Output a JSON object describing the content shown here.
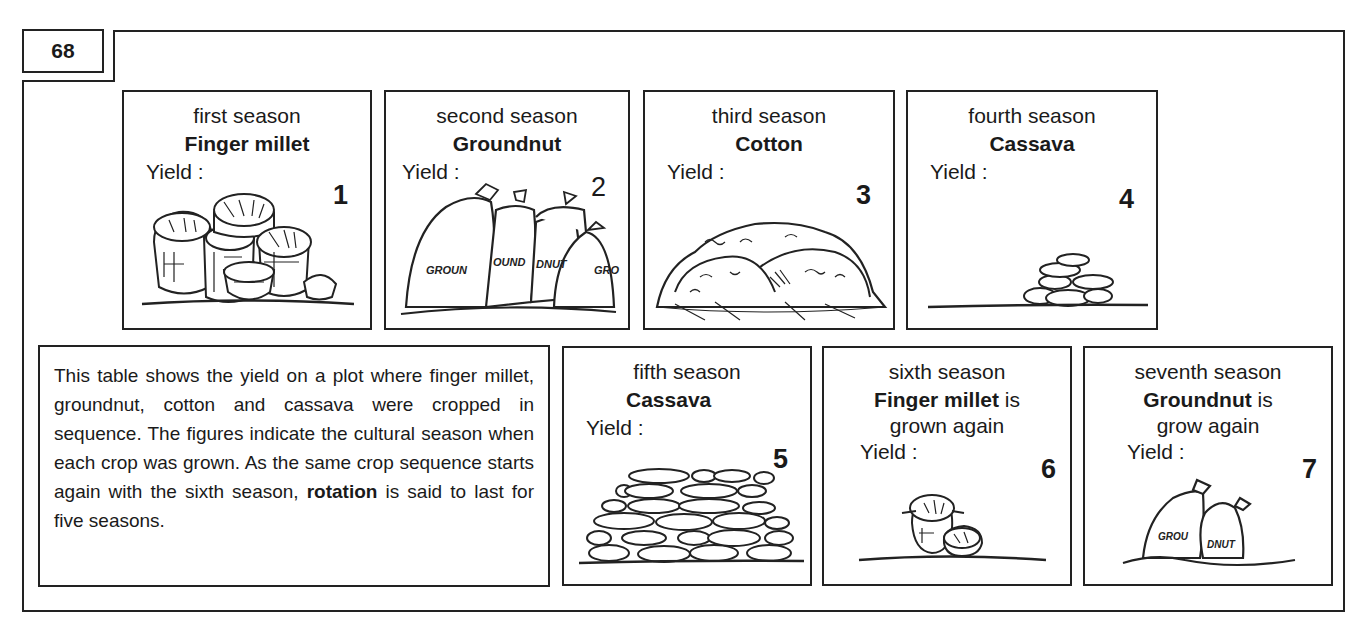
{
  "page": {
    "number": "68"
  },
  "description": {
    "before_bold": "This table shows the yield on a plot where finger millet, groundnut, cotton and cassava were cropped in sequence. The figures indicate the cultural season when each crop was grown. As the same crop sequence starts again with the sixth season, ",
    "bold": "rotation",
    "after_bold": " is said to last for five seasons."
  },
  "seasons": [
    {
      "season": "first season",
      "crop": "Finger millet",
      "suffix": "",
      "again": "",
      "yield_label": "Yield :",
      "number": "1",
      "illustration": "finger-millet-baskets-large"
    },
    {
      "season": "second season",
      "crop": "Groundnut",
      "suffix": "",
      "again": "",
      "yield_label": "Yield :",
      "number": "2",
      "illustration": "groundnut-sacks-large"
    },
    {
      "season": "third season",
      "crop": "Cotton",
      "suffix": "",
      "again": "",
      "yield_label": "Yield :",
      "number": "3",
      "illustration": "cotton-heap-large"
    },
    {
      "season": "fourth season",
      "crop": "Cassava",
      "suffix": "",
      "again": "",
      "yield_label": "Yield :",
      "number": "4",
      "illustration": "cassava-pile-small"
    },
    {
      "season": "fifth season",
      "crop": "Cassava",
      "suffix": "",
      "again": "",
      "yield_label": "Yield :",
      "number": "5",
      "illustration": "cassava-pile-large"
    },
    {
      "season": "sixth season",
      "crop": "Finger millet",
      "suffix": " is",
      "again": "grown again",
      "yield_label": "Yield :",
      "number": "6",
      "illustration": "finger-millet-baskets-small"
    },
    {
      "season": "seventh season",
      "crop": "Groundnut",
      "suffix": " is",
      "again": "grow again",
      "yield_label": "Yield :",
      "number": "7",
      "illustration": "groundnut-sacks-small"
    }
  ],
  "sack_labels": {
    "s2a": "GROUN",
    "s2b": "OUND",
    "s2c": "DNUT",
    "s2d": "GRO",
    "s7a": "GROU",
    "s7b": "DNUT"
  },
  "colors": {
    "ink": "#222222",
    "background": "#ffffff"
  }
}
